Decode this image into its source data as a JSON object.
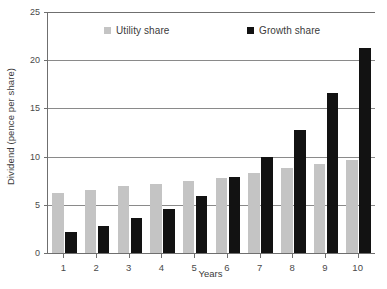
{
  "chart_data": {
    "type": "bar",
    "title": "",
    "xlabel": "Years",
    "ylabel": "Dividend (pence per share)",
    "categories": [
      "1",
      "2",
      "3",
      "4",
      "5",
      "6",
      "7",
      "8",
      "9",
      "10"
    ],
    "series": [
      {
        "name": "Utility share",
        "color": "#c4c4c4",
        "values": [
          6.2,
          6.5,
          7.0,
          7.2,
          7.5,
          7.8,
          8.3,
          8.8,
          9.2,
          9.6
        ]
      },
      {
        "name": "Growth share",
        "color": "#121212",
        "values": [
          2.2,
          2.8,
          3.6,
          4.6,
          5.9,
          7.9,
          10.0,
          12.8,
          16.6,
          21.3
        ]
      }
    ],
    "ylim": [
      0,
      25
    ],
    "yticks": [
      0,
      5,
      10,
      15,
      20,
      25
    ],
    "ytick_labels": [
      "0",
      "5",
      "10",
      "15",
      "20",
      "25"
    ],
    "grid": true,
    "grid_axis": "y",
    "legend_position": "top-inside"
  },
  "legend": {
    "items": [
      {
        "label": "Utility share",
        "color": "#c4c4c4"
      },
      {
        "label": "Growth share",
        "color": "#121212"
      }
    ]
  },
  "axes": {
    "y_title": "Dividend (pence per share)",
    "x_title": "Years",
    "y_tick_labels": [
      "25",
      "20",
      "15",
      "10",
      "5",
      "0"
    ],
    "x_tick_labels": [
      "1",
      "2",
      "3",
      "4",
      "5",
      "6",
      "7",
      "8",
      "9",
      "10"
    ]
  },
  "colors": {
    "utility_share": "#c4c4c4",
    "growth_share": "#121212",
    "axis": "#6f6f6f",
    "gridline": "#8a8a8a",
    "text": "#3b3b3b",
    "background": "#ffffff"
  }
}
